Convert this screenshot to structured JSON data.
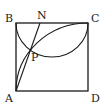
{
  "diagram": {
    "type": "geometry",
    "colors": {
      "stroke": "#1a1a1a",
      "text": "#222222",
      "background": "#ffffff"
    },
    "points": {
      "A": {
        "label": "A",
        "x": 16,
        "y": 91
      },
      "B": {
        "label": "B",
        "x": 16,
        "y": 23
      },
      "C": {
        "label": "C",
        "x": 88,
        "y": 23
      },
      "D": {
        "label": "D",
        "x": 88,
        "y": 91
      },
      "N": {
        "label": "N",
        "x": 40,
        "y": 23
      },
      "P": {
        "label": "P",
        "x": 31,
        "y": 50
      }
    },
    "labels": {
      "A": "A",
      "B": "B",
      "C": "C",
      "D": "D",
      "N": "N",
      "P": "P"
    }
  }
}
